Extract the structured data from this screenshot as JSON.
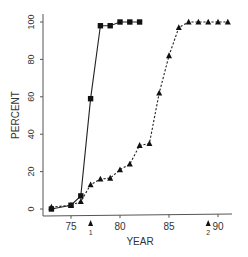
{
  "chart_data": {
    "type": "line",
    "title": "",
    "xlabel": "YEAR",
    "ylabel": "PERCENT",
    "xlim": [
      72.5,
      92.5
    ],
    "ylim": [
      -3,
      103
    ],
    "x_ticks": [
      75,
      80,
      85,
      90
    ],
    "y_ticks": [
      0,
      20,
      40,
      60,
      80,
      100
    ],
    "grid": false,
    "legend": null,
    "series": [
      {
        "name": "series-1",
        "marker": "square",
        "line_style": "solid",
        "x": [
          73,
          75,
          76,
          77,
          78,
          79,
          80,
          81,
          82
        ],
        "values": [
          0,
          2,
          7,
          59,
          98,
          98,
          100,
          100,
          100
        ]
      },
      {
        "name": "series-2",
        "marker": "triangle",
        "line_style": "dashed",
        "x": [
          73,
          75,
          76,
          77,
          78,
          79,
          80,
          81,
          82,
          83,
          84,
          85,
          86,
          87,
          88,
          89,
          90,
          91
        ],
        "values": [
          1,
          2,
          4,
          13,
          16,
          16.5,
          21,
          24,
          34,
          35,
          62,
          82,
          97,
          100,
          100,
          100,
          100,
          100
        ]
      }
    ],
    "annotations": [
      {
        "type": "arrow-marker",
        "x": 77,
        "label": "1"
      },
      {
        "type": "arrow-marker",
        "x": 89,
        "label": "2"
      }
    ]
  },
  "labels": {
    "xlabel": "YEAR",
    "ylabel": "PERCENT",
    "x_ticks": [
      "75",
      "80",
      "85",
      "90"
    ],
    "y_ticks": [
      "0",
      "20",
      "40",
      "60",
      "80",
      "100"
    ],
    "arrow1": "1",
    "arrow2": "2"
  }
}
